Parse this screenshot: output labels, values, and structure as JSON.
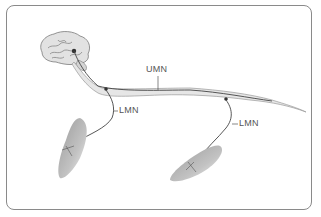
{
  "diagram": {
    "labels": {
      "umn": "UMN",
      "lmn_upper": "LMN",
      "lmn_lower": "LMN"
    },
    "components": [
      "brain",
      "spinal-cord",
      "upper-motor-neuron",
      "lower-motor-neuron-thoracic",
      "lower-motor-neuron-lumbar",
      "muscle-left",
      "muscle-right"
    ],
    "colors": {
      "frame": "#8a8a8a",
      "cord_fill": "#e6e6e6",
      "cord_outline": "#9a9a9a",
      "nerve": "#444444",
      "muscle": "#b5b5b5",
      "label": "#555555"
    }
  }
}
